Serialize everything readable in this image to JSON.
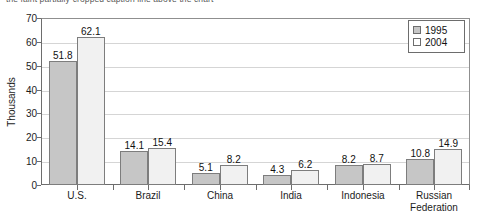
{
  "caption": {
    "clipped_text": "the faint partially-cropped caption line above the chart"
  },
  "colors": {
    "series_1995_fill": "#c6c6c6",
    "series_2004_fill": "#f1f1f1",
    "bar_outline": "#7d7d7d",
    "gridline": "#d5d5d5",
    "axis": "#6d6d6d",
    "text": "#111111"
  },
  "legend": {
    "items": [
      {
        "label": "1995",
        "swatch": "gray-square-swatch"
      },
      {
        "label": "2004",
        "swatch": "white-square-swatch"
      }
    ]
  },
  "axes": {
    "y_title": "Thousands",
    "y_ticks": [
      "0",
      "10",
      "20",
      "30",
      "40",
      "50",
      "60",
      "70"
    ]
  },
  "chart_data": {
    "type": "bar",
    "title": "",
    "xlabel": "",
    "ylabel": "Thousands",
    "ylim": [
      0,
      70
    ],
    "ytick_step": 10,
    "grid": true,
    "legend_position": "top-right",
    "categories": [
      "U.S.",
      "Brazil",
      "China",
      "India",
      "Indonesia",
      "Russian\nFederation"
    ],
    "category_labels": [
      [
        "U.S."
      ],
      [
        "Brazil"
      ],
      [
        "China"
      ],
      [
        "India"
      ],
      [
        "Indonesia"
      ],
      [
        "Russian",
        "Federation"
      ]
    ],
    "series": [
      {
        "name": "1995",
        "values": [
          51.8,
          14.1,
          5.1,
          4.3,
          8.2,
          10.8
        ]
      },
      {
        "name": "2004",
        "values": [
          62.1,
          15.4,
          8.2,
          6.2,
          8.7,
          14.9
        ]
      }
    ],
    "value_labels": {
      "1995": [
        "51.8",
        "14.1",
        "5.1",
        "4.3",
        "8.2",
        "10.8"
      ],
      "2004": [
        "62.1",
        "15.4",
        "8.2",
        "6.2",
        "8.7",
        "14.9"
      ]
    }
  }
}
